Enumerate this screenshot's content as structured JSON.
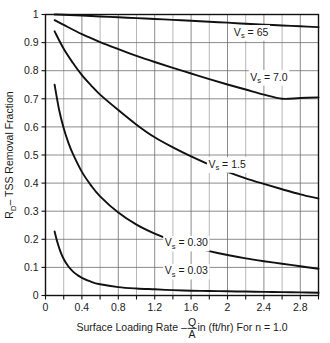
{
  "chart_data": {
    "type": "line",
    "title": "",
    "subtitle": "",
    "xlabel_parts": {
      "prefix": "Surface Loading Rate – ",
      "numerator": "Q",
      "denominator": "A",
      "suffix": " in (ft/hr) For n = 1.0"
    },
    "xlabel": "Surface Loading Rate – Q/A in (ft/hr) For n = 1.0",
    "ylabel_parts": {
      "symbol": "R",
      "symbol_sub": "D",
      "rest": "– TSS Removal Fraction"
    },
    "ylabel": "R_D – TSS Removal Fraction",
    "xlim": [
      0,
      3.0
    ],
    "ylim": [
      0,
      1.0
    ],
    "grid": true,
    "grid_minor_x_step": 0.2,
    "grid_major_x_step": 0.4,
    "grid_y_step": 0.1,
    "legend_position": "inline-annotations",
    "xticks": [
      0,
      0.4,
      0.8,
      1.2,
      1.6,
      2,
      2.4,
      2.8
    ],
    "xticklabels": [
      "0",
      "0.4",
      "0.8",
      "1.2",
      "1.6",
      "2",
      "2.4",
      "2.8"
    ],
    "yticks": [
      0,
      0.1,
      0.2,
      0.3,
      0.4,
      0.5,
      0.6,
      0.7,
      0.8,
      0.9,
      1
    ],
    "yticklabels": [
      "0",
      "0.1",
      "0.2",
      "0.3",
      "0.4",
      "0.5",
      "0.6",
      "0.7",
      "0.8",
      "0.9",
      "1"
    ],
    "series": [
      {
        "name": "Vs = 65",
        "label_prefix": "V",
        "label_sub": "s",
        "label_suffix": " = 65",
        "label_x": 2.07,
        "label_y": 0.925,
        "x": [
          0.1,
          0.2,
          0.4,
          0.6,
          0.8,
          1.0,
          1.2,
          1.4,
          1.6,
          1.8,
          2.0,
          2.2,
          2.4,
          2.6,
          2.8,
          3.0
        ],
        "y": [
          1.0,
          0.999,
          0.996,
          0.993,
          0.99,
          0.987,
          0.984,
          0.981,
          0.978,
          0.974,
          0.971,
          0.967,
          0.964,
          0.961,
          0.958,
          0.955
        ]
      },
      {
        "name": "Vs = 7.0",
        "label_prefix": "V",
        "label_sub": "s",
        "label_suffix": " = 7.0",
        "label_x": 2.25,
        "label_y": 0.765,
        "x": [
          0.1,
          0.2,
          0.4,
          0.6,
          0.8,
          1.0,
          1.2,
          1.4,
          1.6,
          1.8,
          2.0,
          2.2,
          2.4,
          2.6,
          2.8,
          3.0
        ],
        "y": [
          0.98,
          0.963,
          0.93,
          0.902,
          0.877,
          0.853,
          0.831,
          0.81,
          0.79,
          0.77,
          0.751,
          0.733,
          0.715,
          0.7,
          0.703,
          0.705
        ]
      },
      {
        "name": "Vs = 1.5",
        "label_prefix": "V",
        "label_sub": "s",
        "label_suffix": " = 1.5",
        "label_x": 1.79,
        "label_y": 0.455,
        "x": [
          0.1,
          0.2,
          0.3,
          0.4,
          0.5,
          0.6,
          0.8,
          1.0,
          1.2,
          1.4,
          1.6,
          1.8,
          2.0,
          2.2,
          2.4,
          2.6,
          2.8,
          3.0
        ],
        "y": [
          0.94,
          0.878,
          0.828,
          0.784,
          0.748,
          0.715,
          0.66,
          0.608,
          0.563,
          0.527,
          0.495,
          0.466,
          0.44,
          0.417,
          0.397,
          0.378,
          0.36,
          0.345
        ]
      },
      {
        "name": "Vs = 0.30",
        "label_prefix": "V",
        "label_sub": "s",
        "label_suffix": " = 0.30",
        "label_x": 1.31,
        "label_y": 0.175,
        "x": [
          0.1,
          0.15,
          0.2,
          0.25,
          0.3,
          0.4,
          0.5,
          0.6,
          0.8,
          1.0,
          1.2,
          1.4,
          1.6,
          1.8,
          2.0,
          2.2,
          2.4,
          2.6,
          2.8,
          3.0
        ],
        "y": [
          0.75,
          0.66,
          0.595,
          0.545,
          0.505,
          0.44,
          0.392,
          0.353,
          0.295,
          0.252,
          0.22,
          0.195,
          0.175,
          0.158,
          0.144,
          0.132,
          0.122,
          0.113,
          0.104,
          0.095
        ]
      },
      {
        "name": "Vs = 0.03",
        "label_prefix": "V",
        "label_sub": "s",
        "label_suffix": " = 0.03",
        "label_x": 1.31,
        "label_y": 0.075,
        "x": [
          0.1,
          0.13,
          0.16,
          0.2,
          0.25,
          0.3,
          0.35,
          0.4,
          0.5,
          0.6,
          0.8,
          1.0,
          1.2,
          1.4,
          1.6,
          1.8,
          2.0,
          2.2,
          2.4,
          2.6,
          2.8,
          3.0
        ],
        "y": [
          0.228,
          0.19,
          0.16,
          0.13,
          0.104,
          0.086,
          0.073,
          0.063,
          0.049,
          0.04,
          0.03,
          0.025,
          0.022,
          0.019,
          0.017,
          0.016,
          0.015,
          0.014,
          0.013,
          0.012,
          0.011,
          0.01
        ]
      }
    ],
    "colors": {
      "curve": "#111111",
      "grid_minor": "#9a9a9a",
      "grid_major": "#6e6e6e",
      "axis": "#111111",
      "background": "#ffffff",
      "text": "#1a1a1a"
    }
  }
}
